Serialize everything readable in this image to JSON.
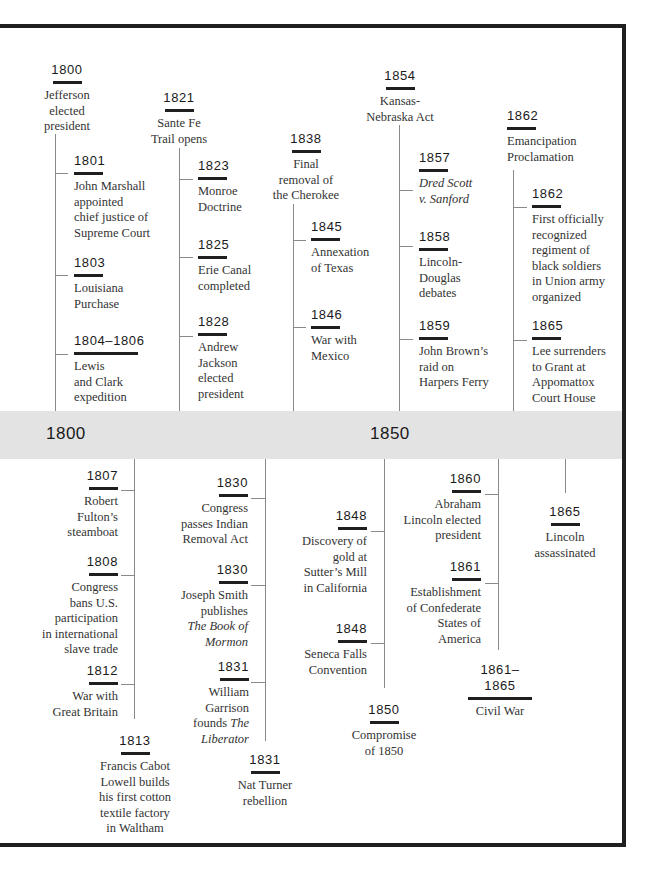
{
  "colors": {
    "frame": "#1f1f1f",
    "band": "#e3e3e3",
    "line": "#8a8a8a",
    "text": "#333333",
    "year": "#1a1a1a"
  },
  "band": {
    "labels": [
      {
        "text": "1800",
        "x": 46
      },
      {
        "text": "1850",
        "x": 370
      }
    ]
  },
  "lines": {
    "vertical": [
      {
        "x": 55,
        "y1": 134,
        "y2": 411
      },
      {
        "x": 179,
        "y1": 148,
        "y2": 411
      },
      {
        "x": 293,
        "y1": 204,
        "y2": 411
      },
      {
        "x": 399,
        "y1": 125,
        "y2": 411
      },
      {
        "x": 513,
        "y1": 170,
        "y2": 411
      },
      {
        "x": 134,
        "y1": 459,
        "y2": 719
      },
      {
        "x": 265,
        "y1": 459,
        "y2": 741
      },
      {
        "x": 384,
        "y1": 459,
        "y2": 688
      },
      {
        "x": 498,
        "y1": 459,
        "y2": 650
      },
      {
        "x": 565,
        "y1": 459,
        "y2": 493
      }
    ],
    "ticks": [
      {
        "x": 55,
        "y": 173,
        "w": 13
      },
      {
        "x": 55,
        "y": 275,
        "w": 13
      },
      {
        "x": 55,
        "y": 354,
        "w": 13
      },
      {
        "x": 179,
        "y": 179,
        "w": 14
      },
      {
        "x": 179,
        "y": 257,
        "w": 14
      },
      {
        "x": 179,
        "y": 336,
        "w": 14
      },
      {
        "x": 293,
        "y": 240,
        "w": 13
      },
      {
        "x": 293,
        "y": 327,
        "w": 13
      },
      {
        "x": 399,
        "y": 190,
        "w": 14
      },
      {
        "x": 399,
        "y": 246,
        "w": 14
      },
      {
        "x": 399,
        "y": 339,
        "w": 14
      },
      {
        "x": 513,
        "y": 207,
        "w": 14
      },
      {
        "x": 513,
        "y": 340,
        "w": 14
      },
      {
        "x": 121,
        "y": 490,
        "w": 13
      },
      {
        "x": 121,
        "y": 575,
        "w": 13
      },
      {
        "x": 121,
        "y": 684,
        "w": 13
      },
      {
        "x": 251,
        "y": 498,
        "w": 14
      },
      {
        "x": 251,
        "y": 585,
        "w": 14
      },
      {
        "x": 251,
        "y": 682,
        "w": 14
      },
      {
        "x": 371,
        "y": 531,
        "w": 13
      },
      {
        "x": 371,
        "y": 643,
        "w": 13
      },
      {
        "x": 485,
        "y": 494,
        "w": 13
      },
      {
        "x": 485,
        "y": 583,
        "w": 13
      }
    ]
  },
  "events": [
    {
      "year": "1800",
      "desc": [
        "Jefferson",
        "elected",
        "president"
      ],
      "x": 33,
      "y": 60,
      "w": 68,
      "rule": 29,
      "align": "center"
    },
    {
      "year": "1821",
      "desc": [
        "Sante Fe",
        "Trail opens"
      ],
      "x": 142,
      "y": 88,
      "w": 74,
      "rule": 29,
      "align": "center"
    },
    {
      "year": "1838",
      "desc": [
        "Final",
        "removal of",
        "the Cherokee"
      ],
      "x": 266,
      "y": 129,
      "w": 80,
      "rule": 29,
      "align": "center"
    },
    {
      "year": "1854",
      "desc": [
        "Kansas-",
        "Nebraska Act"
      ],
      "x": 358,
      "y": 66,
      "w": 84,
      "rule": 29,
      "align": "center"
    },
    {
      "year": "1862",
      "desc": [
        "Emancipation",
        "Proclamation"
      ],
      "x": 507,
      "y": 106,
      "w": 90,
      "rule": 29,
      "align": "left"
    },
    {
      "year": "1801",
      "desc": [
        "John Marshall",
        "appointed",
        "chief justice of",
        "Supreme Court"
      ],
      "x": 74,
      "y": 151,
      "w": 100,
      "rule": 29,
      "align": "left"
    },
    {
      "year": "1803",
      "desc": [
        "Louisiana",
        "Purchase"
      ],
      "x": 74,
      "y": 253,
      "w": 100,
      "rule": 29,
      "align": "left"
    },
    {
      "year": "1804–1806",
      "desc": [
        "Lewis",
        "and Clark",
        "expedition"
      ],
      "x": 74,
      "y": 331,
      "w": 100,
      "rule": 64,
      "align": "left"
    },
    {
      "year": "1823",
      "desc": [
        "Monroe",
        "Doctrine"
      ],
      "x": 198,
      "y": 156,
      "w": 80,
      "rule": 29,
      "align": "left"
    },
    {
      "year": "1825",
      "desc": [
        "Erie Canal",
        "completed"
      ],
      "x": 198,
      "y": 235,
      "w": 80,
      "rule": 29,
      "align": "left"
    },
    {
      "year": "1828",
      "desc": [
        "Andrew",
        "Jackson",
        "elected",
        "president"
      ],
      "x": 198,
      "y": 312,
      "w": 80,
      "rule": 29,
      "align": "left"
    },
    {
      "year": "1845",
      "desc": [
        "Annexation",
        "of Texas"
      ],
      "x": 311,
      "y": 217,
      "w": 80,
      "rule": 29,
      "align": "left"
    },
    {
      "year": "1846",
      "desc": [
        "War with",
        "Mexico"
      ],
      "x": 311,
      "y": 305,
      "w": 80,
      "rule": 29,
      "align": "left"
    },
    {
      "year": "1857",
      "desc": [
        "<i>Dred Scott</i>",
        "<i>v. Sanford</i>"
      ],
      "x": 419,
      "y": 148,
      "w": 80,
      "rule": 29,
      "align": "left"
    },
    {
      "year": "1858",
      "desc": [
        "Lincoln-",
        "Douglas",
        "debates"
      ],
      "x": 419,
      "y": 227,
      "w": 80,
      "rule": 29,
      "align": "left"
    },
    {
      "year": "1859",
      "desc": [
        "John Brown’s",
        "raid on",
        "Harpers Ferry"
      ],
      "x": 419,
      "y": 316,
      "w": 90,
      "rule": 29,
      "align": "left"
    },
    {
      "year": "1862",
      "desc": [
        "First officially",
        "recognized",
        "regiment of",
        "black soldiers",
        "in Union army",
        "organized"
      ],
      "x": 532,
      "y": 184,
      "w": 90,
      "rule": 29,
      "align": "left"
    },
    {
      "year": "1865",
      "desc": [
        "Lee surrenders",
        "to Grant at",
        "Appomattox",
        "Court House"
      ],
      "x": 532,
      "y": 316,
      "w": 90,
      "rule": 29,
      "align": "left"
    },
    {
      "year": "1807",
      "desc": [
        "Robert",
        "Fulton’s",
        "steamboat"
      ],
      "x": 30,
      "y": 466,
      "w": 88,
      "rule": 29,
      "align": "right"
    },
    {
      "year": "1808",
      "desc": [
        "Congress",
        "bans U.S.",
        "participation",
        "in international",
        "slave trade"
      ],
      "x": 30,
      "y": 552,
      "w": 88,
      "rule": 29,
      "align": "right"
    },
    {
      "year": "1812",
      "desc": [
        "War with",
        "Great Britain"
      ],
      "x": 30,
      "y": 661,
      "w": 88,
      "rule": 29,
      "align": "right"
    },
    {
      "year": "1813",
      "desc": [
        "Francis Cabot",
        "Lowell builds",
        "his first cotton",
        "textile factory",
        "in Waltham"
      ],
      "x": 90,
      "y": 731,
      "w": 90,
      "rule": 29,
      "align": "center"
    },
    {
      "year": "1830",
      "desc": [
        "Congress",
        "passes Indian",
        "Removal Act"
      ],
      "x": 160,
      "y": 473,
      "w": 88,
      "rule": 29,
      "align": "right"
    },
    {
      "year": "1830",
      "desc": [
        "Joseph Smith",
        "publishes",
        "<i>The Book of</i>",
        "<i>Mormon</i>"
      ],
      "x": 160,
      "y": 560,
      "w": 88,
      "rule": 29,
      "align": "right"
    },
    {
      "year": "1831",
      "desc": [
        "William",
        "Garrison",
        "founds <i>The</i>",
        "<i>Liberator</i>"
      ],
      "x": 160,
      "y": 657,
      "w": 89,
      "rule": 29,
      "align": "right"
    },
    {
      "year": "1831",
      "desc": [
        "Nat Turner",
        "rebellion"
      ],
      "x": 230,
      "y": 750,
      "w": 70,
      "rule": 29,
      "align": "center"
    },
    {
      "year": "1848",
      "desc": [
        "Discovery of",
        "gold at",
        "Sutter’s Mill",
        "in California"
      ],
      "x": 280,
      "y": 506,
      "w": 87,
      "rule": 29,
      "align": "right"
    },
    {
      "year": "1848",
      "desc": [
        "Seneca Falls",
        "Convention"
      ],
      "x": 280,
      "y": 619,
      "w": 87,
      "rule": 29,
      "align": "right"
    },
    {
      "year": "1850",
      "desc": [
        "Compromise",
        "of 1850"
      ],
      "x": 345,
      "y": 700,
      "w": 78,
      "rule": 29,
      "align": "center"
    },
    {
      "year": "1860",
      "desc": [
        "Abraham",
        "Lincoln elected",
        "president"
      ],
      "x": 390,
      "y": 469,
      "w": 91,
      "rule": 29,
      "align": "right"
    },
    {
      "year": "1861",
      "desc": [
        "Establishment",
        "of Confederate",
        "States of",
        "America"
      ],
      "x": 390,
      "y": 557,
      "w": 91,
      "rule": 29,
      "align": "right"
    },
    {
      "year": "1861–1865",
      "desc": [
        "Civil War"
      ],
      "x": 465,
      "y": 662,
      "w": 70,
      "rule": 64,
      "align": "center"
    },
    {
      "year": "1865",
      "desc": [
        "Lincoln",
        "assassinated"
      ],
      "x": 525,
      "y": 502,
      "w": 80,
      "rule": 29,
      "align": "center"
    }
  ]
}
